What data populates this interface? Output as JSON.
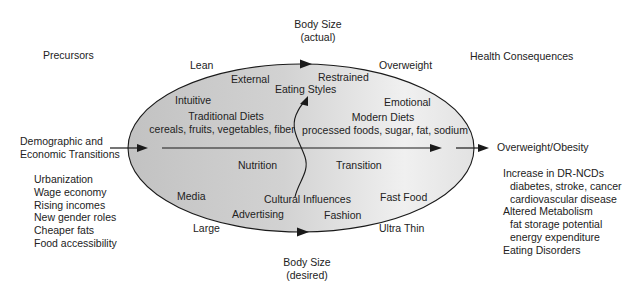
{
  "diagram": {
    "title_top": {
      "line1": "Body Size",
      "line2": "(actual)"
    },
    "title_bottom": {
      "line1": "Body Size",
      "line2": "(desired)"
    },
    "precursors": {
      "heading": "Precursors",
      "input_label_line1": "Demographic and",
      "input_label_line2": "Economic Transitions",
      "items": [
        "Urbanization",
        "Wage economy",
        "Rising incomes",
        "New gender roles",
        "Cheaper fats",
        "Food accessibility"
      ]
    },
    "health_consequences": {
      "heading": "Health Consequences",
      "output_label": "Overweight/Obesity",
      "items": [
        {
          "text": "Increase in DR-NCDs",
          "level": 0
        },
        {
          "text": "diabetes, stroke, cancer",
          "level": 1
        },
        {
          "text": "cardiovascular disease",
          "level": 1
        },
        {
          "text": "Altered Metabolism",
          "level": 0
        },
        {
          "text": "fat storage potential",
          "level": 1
        },
        {
          "text": "energy expenditure",
          "level": 1
        },
        {
          "text": "Eating Disorders",
          "level": 0
        }
      ]
    },
    "body_size_actual": {
      "left": "Lean",
      "right": "Overweight"
    },
    "body_size_desired": {
      "left": "Large",
      "right": "Ultra Thin"
    },
    "eating_styles": {
      "label": "Eating Styles",
      "intuitive": "Intuitive",
      "external": "External",
      "restrained": "Restrained",
      "emotional": "Emotional"
    },
    "diets": {
      "traditional_title": "Traditional Diets",
      "traditional_foods": "cereals, fruits, vegetables, fiber",
      "modern_title": "Modern Diets",
      "modern_foods": "processed foods, sugar, fat, sodium"
    },
    "nutrition_transition": {
      "left": "Nutrition",
      "right": "Transition"
    },
    "cultural_influences": {
      "label": "Cultural Influences",
      "media": "Media",
      "advertising": "Advertising",
      "fashion": "Fashion",
      "fast_food": "Fast Food"
    },
    "colors": {
      "ellipse_dark": "#c4c4c4",
      "ellipse_light": "#fafafa",
      "stroke": "#1a1a1a",
      "text": "#222222"
    }
  }
}
